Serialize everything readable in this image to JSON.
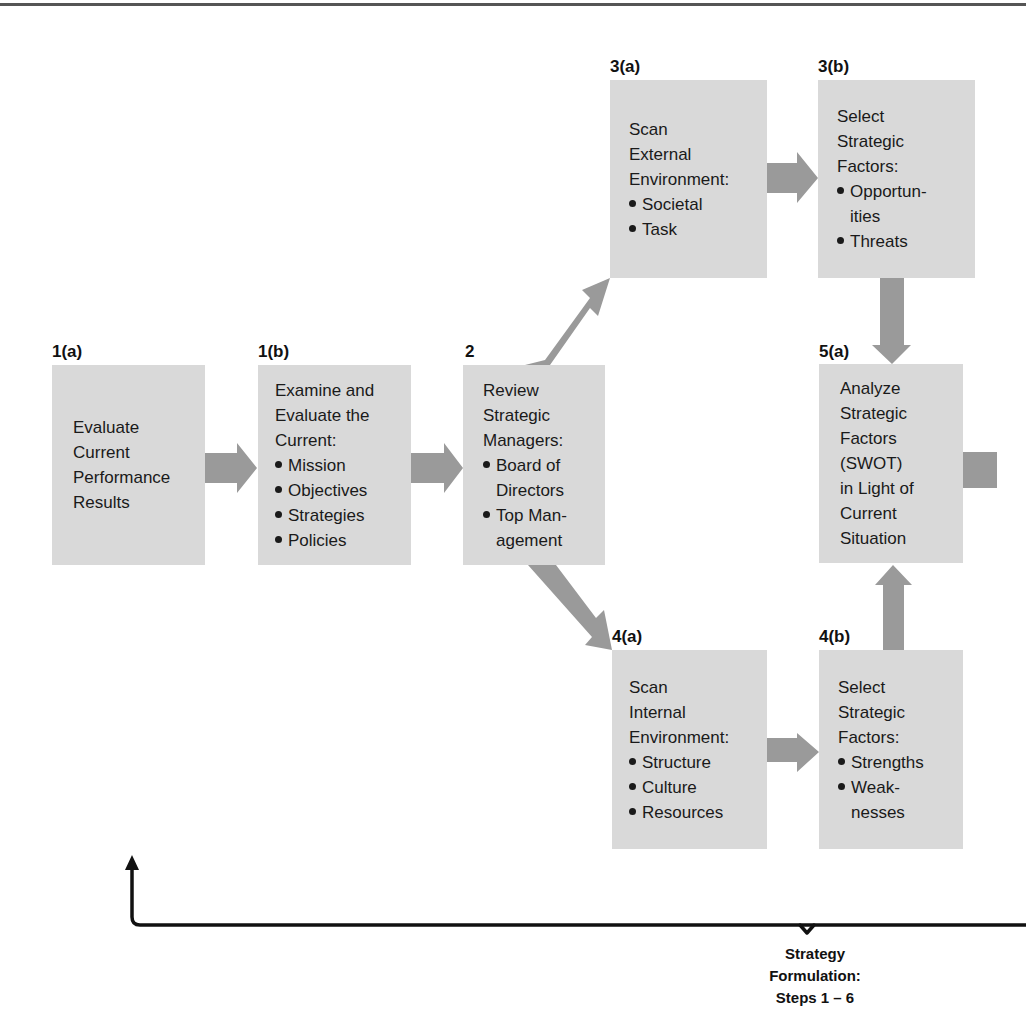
{
  "diagram": {
    "colors": {
      "box_fill": "#d9d9d9",
      "arrow_fill": "#9a9a9a",
      "bracket": "#111111"
    },
    "steps": [
      {
        "id": "1a",
        "label": "1(a)",
        "lines": [
          "Evaluate",
          "Current",
          "Performance",
          "Results"
        ],
        "bullets": []
      },
      {
        "id": "1b",
        "label": "1(b)",
        "lines": [
          "Examine and",
          "Evaluate the",
          "Current:"
        ],
        "bullets": [
          [
            "Mission"
          ],
          [
            "Objectives"
          ],
          [
            "Strategies"
          ],
          [
            "Policies"
          ]
        ]
      },
      {
        "id": "2",
        "label": "2",
        "lines": [
          "Review",
          "Strategic",
          "Managers:"
        ],
        "bullets": [
          [
            "Board of",
            "Directors"
          ],
          [
            "Top Man-",
            "agement"
          ]
        ]
      },
      {
        "id": "3a",
        "label": "3(a)",
        "lines": [
          "Scan",
          "External",
          "Environment:"
        ],
        "bullets": [
          [
            "Societal"
          ],
          [
            "Task"
          ]
        ]
      },
      {
        "id": "3b",
        "label": "3(b)",
        "lines": [
          "Select",
          "Strategic",
          "Factors:"
        ],
        "bullets": [
          [
            "Opportun-",
            "ities"
          ],
          [
            "Threats"
          ]
        ]
      },
      {
        "id": "4a",
        "label": "4(a)",
        "lines": [
          "Scan",
          "Internal",
          "Environment:"
        ],
        "bullets": [
          [
            "Structure"
          ],
          [
            "Culture"
          ],
          [
            "Resources"
          ]
        ]
      },
      {
        "id": "4b",
        "label": "4(b)",
        "lines": [
          "Select",
          "Strategic",
          "Factors:"
        ],
        "bullets": [
          [
            "Strengths"
          ],
          [
            "Weak-",
            "nesses"
          ]
        ]
      },
      {
        "id": "5a",
        "label": "5(a)",
        "lines": [
          "Analyze",
          "Strategic",
          "Factors",
          "(SWOT)",
          "in Light of",
          "Current",
          "Situation"
        ],
        "bullets": []
      }
    ],
    "connections": [
      {
        "from": "1a",
        "to": "1b"
      },
      {
        "from": "1b",
        "to": "2"
      },
      {
        "from": "2",
        "to": "3a"
      },
      {
        "from": "2",
        "to": "4a"
      },
      {
        "from": "3a",
        "to": "3b"
      },
      {
        "from": "4a",
        "to": "4b"
      },
      {
        "from": "3b",
        "to": "5a"
      },
      {
        "from": "4b",
        "to": "5a"
      },
      {
        "from": "5a",
        "to": "offscreen-right"
      }
    ],
    "footer": {
      "brace_label": [
        "Strategy",
        "Formulation:",
        "Steps 1 – 6"
      ]
    }
  }
}
